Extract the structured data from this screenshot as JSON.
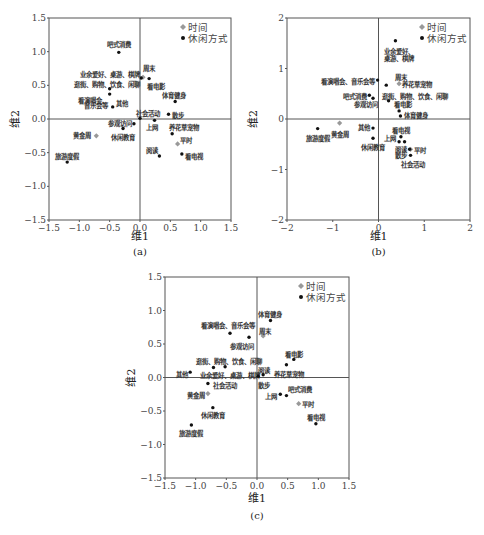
{
  "chart_data": [
    {
      "id": "a",
      "type": "scatter",
      "caption": "(a)",
      "xlabel": "维1",
      "ylabel": "维2",
      "xlim": [
        -1.5,
        1.5
      ],
      "ylim": [
        -1.5,
        1.5
      ],
      "xticks": [
        -1.5,
        -1.0,
        -0.5,
        0.0,
        0.5,
        1.0,
        1.5
      ],
      "yticks": [
        -1.5,
        -1.0,
        -0.5,
        0.0,
        0.5,
        1.0,
        1.5
      ],
      "tick_labels_x": [
        "−1.5",
        "−1.0",
        "−0.5",
        "0.0",
        "0.5",
        "1.0",
        "1.5"
      ],
      "tick_labels_y": [
        "−1.5",
        "−1.0",
        "−0.5",
        "0.0",
        "0.5",
        "1.0",
        "1.5"
      ],
      "grid": false,
      "legend": {
        "position": "top-right",
        "entries": [
          {
            "label": "时间",
            "marker": "diamond",
            "color": "#999999"
          },
          {
            "label": "休闲方式",
            "marker": "circle",
            "color": "#111111"
          }
        ]
      },
      "series": [
        {
          "name": "时间",
          "points": [
            {
              "label": "周末",
              "x": 0.05,
              "y": 0.62,
              "lx": 0.05,
              "ly": 0.75,
              "anchor": "start"
            },
            {
              "label": "平时",
              "x": 0.62,
              "y": -0.37,
              "lx": 0.66,
              "ly": -0.32,
              "anchor": "start"
            },
            {
              "label": "黄金周",
              "x": -0.72,
              "y": -0.25,
              "lx": -0.8,
              "ly": -0.25,
              "anchor": "end"
            }
          ]
        },
        {
          "name": "休闲方式",
          "points": [
            {
              "label": "吧式消费",
              "x": -0.35,
              "y": 0.99,
              "lx": -0.35,
              "ly": 1.1,
              "anchor": "middle"
            },
            {
              "label": "业余爱好、桌游、棋牌",
              "x": 0.02,
              "y": 0.61,
              "lx": 0.0,
              "ly": 0.66,
              "anchor": "end"
            },
            {
              "label": "看电影",
              "x": 0.15,
              "y": 0.6,
              "lx": 0.12,
              "ly": 0.48,
              "anchor": "start"
            },
            {
              "label": "逛街、购物、饮食、闲聊",
              "x": -0.5,
              "y": 0.45,
              "lx": 0.0,
              "ly": 0.51,
              "anchor": "end"
            },
            {
              "label": "看演唱会、",
              "x": -0.5,
              "y": 0.37,
              "lx": -0.53,
              "ly": 0.28,
              "anchor": "end"
            },
            {
              "label": "音乐会等",
              "x": -0.5,
              "y": 0.37,
              "lx": -0.53,
              "ly": 0.2,
              "anchor": "end"
            },
            {
              "label": "其他",
              "x": -0.45,
              "y": 0.18,
              "lx": -0.4,
              "ly": 0.23,
              "anchor": "start"
            },
            {
              "label": "体育健身",
              "x": 0.58,
              "y": 0.26,
              "lx": 0.56,
              "ly": 0.35,
              "anchor": "middle"
            },
            {
              "label": "社会活动",
              "x": 0.0,
              "y": 0.01,
              "lx": -0.07,
              "ly": 0.08,
              "anchor": "start"
            },
            {
              "label": "散步",
              "x": 0.47,
              "y": 0.07,
              "lx": 0.53,
              "ly": 0.05,
              "anchor": "start"
            },
            {
              "label": "上网",
              "x": 0.24,
              "y": -0.02,
              "lx": 0.1,
              "ly": -0.13,
              "anchor": "start"
            },
            {
              "label": "参观访问",
              "x": -0.1,
              "y": -0.07,
              "lx": -0.13,
              "ly": -0.07,
              "anchor": "end"
            },
            {
              "label": "休闲教育",
              "x": -0.28,
              "y": -0.14,
              "lx": -0.28,
              "ly": -0.27,
              "anchor": "middle"
            },
            {
              "label": "养花草宠物",
              "x": 0.53,
              "y": -0.22,
              "lx": 0.48,
              "ly": -0.13,
              "anchor": "start"
            },
            {
              "label": "阅读",
              "x": 0.32,
              "y": -0.55,
              "lx": 0.3,
              "ly": -0.47,
              "anchor": "end"
            },
            {
              "label": "看电视",
              "x": 0.69,
              "y": -0.52,
              "lx": 0.74,
              "ly": -0.55,
              "anchor": "start"
            },
            {
              "label": "旅游度假",
              "x": -1.2,
              "y": -0.64,
              "lx": -1.2,
              "ly": -0.55,
              "anchor": "middle"
            }
          ]
        }
      ]
    },
    {
      "id": "b",
      "type": "scatter",
      "caption": "(b)",
      "xlabel": "维1",
      "ylabel": "维2",
      "xlim": [
        -2,
        2
      ],
      "ylim": [
        -2,
        2
      ],
      "xticks": [
        -2,
        -1,
        0,
        1,
        2
      ],
      "yticks": [
        -2,
        -1,
        0,
        1,
        2
      ],
      "tick_labels_x": [
        "−2",
        "−1",
        "0",
        "1",
        "2"
      ],
      "tick_labels_y": [
        "−2",
        "−1",
        "0",
        "1",
        "2"
      ],
      "grid": false,
      "legend": {
        "position": "top-right",
        "entries": [
          {
            "label": "时间",
            "marker": "diamond",
            "color": "#999999"
          },
          {
            "label": "休闲方式",
            "marker": "circle",
            "color": "#111111"
          }
        ]
      },
      "series": [
        {
          "name": "时间",
          "points": [
            {
              "label": "周末",
              "x": 0.45,
              "y": 0.7,
              "lx": 0.5,
              "ly": 0.82,
              "anchor": "middle"
            },
            {
              "label": "平时",
              "x": 0.7,
              "y": -0.6,
              "lx": 0.78,
              "ly": -0.62,
              "anchor": "start"
            },
            {
              "label": "黄金周",
              "x": -0.85,
              "y": -0.08,
              "lx": -0.85,
              "ly": -0.3,
              "anchor": "middle"
            }
          ]
        },
        {
          "name": "休闲方式",
          "points": [
            {
              "label": "业余爱好、",
              "x": 0.37,
              "y": 1.55,
              "lx": 0.11,
              "ly": 1.33,
              "anchor": "start"
            },
            {
              "label": "桌游、棋牌",
              "x": 0.37,
              "y": 1.55,
              "lx": 0.11,
              "ly": 1.2,
              "anchor": "start"
            },
            {
              "label": "看演唱会、音乐会等",
              "x": -0.02,
              "y": 0.77,
              "lx": -0.07,
              "ly": 0.75,
              "anchor": "end"
            },
            {
              "label": "养花草宠物",
              "x": 0.17,
              "y": 0.67,
              "lx": 0.52,
              "ly": 0.69,
              "anchor": "start"
            },
            {
              "label": "吧式消费",
              "x": -0.2,
              "y": 0.47,
              "lx": -0.25,
              "ly": 0.45,
              "anchor": "end"
            },
            {
              "label": "参观访问",
              "x": -0.12,
              "y": 0.41,
              "lx": -0.02,
              "ly": 0.28,
              "anchor": "end"
            },
            {
              "label": "逛街、购物、饮食、闲聊",
              "x": 0.22,
              "y": 0.36,
              "lx": 0.08,
              "ly": 0.45,
              "anchor": "start"
            },
            {
              "label": "看电影",
              "x": 0.45,
              "y": 0.16,
              "lx": 0.33,
              "ly": 0.28,
              "anchor": "start"
            },
            {
              "label": "体育健身",
              "x": 0.48,
              "y": 0.06,
              "lx": 0.55,
              "ly": 0.07,
              "anchor": "start"
            },
            {
              "label": "其他",
              "x": -0.12,
              "y": -0.18,
              "lx": -0.18,
              "ly": -0.16,
              "anchor": "end"
            },
            {
              "label": "旅游度假",
              "x": -1.33,
              "y": -0.19,
              "lx": -1.33,
              "ly": -0.38,
              "anchor": "middle"
            },
            {
              "label": "休闲教育",
              "x": -0.12,
              "y": -0.38,
              "lx": -0.12,
              "ly": -0.56,
              "anchor": "middle"
            },
            {
              "label": "看电视",
              "x": 0.49,
              "y": -0.35,
              "lx": 0.5,
              "ly": -0.22,
              "anchor": "middle"
            },
            {
              "label": "上网",
              "x": 0.45,
              "y": -0.45,
              "lx": 0.38,
              "ly": -0.38,
              "anchor": "end"
            },
            {
              "label": "阅读",
              "x": 0.57,
              "y": -0.45,
              "lx": 0.37,
              "ly": -0.6,
              "anchor": "start"
            },
            {
              "label": "散步",
              "x": 0.68,
              "y": -0.6,
              "lx": 0.37,
              "ly": -0.73,
              "anchor": "start"
            },
            {
              "label": "社会活动",
              "x": 0.7,
              "y": -0.72,
              "lx": 0.75,
              "ly": -0.9,
              "anchor": "middle"
            }
          ]
        }
      ]
    },
    {
      "id": "c",
      "type": "scatter",
      "caption": "(c)",
      "xlabel": "维1",
      "ylabel": "维2",
      "xlim": [
        -1.5,
        1.5
      ],
      "ylim": [
        -1.5,
        1.5
      ],
      "xticks": [
        -1.5,
        -1.0,
        -0.5,
        0.0,
        0.5,
        1.0,
        1.5
      ],
      "yticks": [
        -1.5,
        -1.0,
        -0.5,
        0.0,
        0.5,
        1.0,
        1.5
      ],
      "tick_labels_x": [
        "−1.5",
        "−1.0",
        "−0.5",
        "0.0",
        "0.5",
        "1.0",
        "1.5"
      ],
      "tick_labels_y": [
        "−1.5",
        "−1.0",
        "−0.5",
        "0.0",
        "0.5",
        "1.0",
        "1.5"
      ],
      "grid": false,
      "legend": {
        "position": "top-right",
        "entries": [
          {
            "label": "时间",
            "marker": "diamond",
            "color": "#999999"
          },
          {
            "label": "休闲方式",
            "marker": "circle",
            "color": "#111111"
          }
        ]
      },
      "series": [
        {
          "name": "时间",
          "points": [
            {
              "label": "周末",
              "x": 0.1,
              "y": 0.62,
              "lx": 0.04,
              "ly": 0.68,
              "anchor": "start"
            },
            {
              "label": "平时",
              "x": 0.68,
              "y": -0.39,
              "lx": 0.73,
              "ly": -0.41,
              "anchor": "start"
            },
            {
              "label": "黄金周",
              "x": -0.8,
              "y": -0.24,
              "lx": -0.84,
              "ly": -0.27,
              "anchor": "end"
            }
          ]
        },
        {
          "name": "休闲方式",
          "points": [
            {
              "label": "体育健身",
              "x": 0.22,
              "y": 0.85,
              "lx": 0.02,
              "ly": 0.94,
              "anchor": "start"
            },
            {
              "label": "看演唱会、音乐会等",
              "x": -0.44,
              "y": 0.66,
              "lx": -0.48,
              "ly": 0.77,
              "anchor": "middle"
            },
            {
              "label": "参观访问",
              "x": -0.13,
              "y": 0.6,
              "lx": -0.25,
              "ly": 0.47,
              "anchor": "middle"
            },
            {
              "label": "看电影",
              "x": 0.6,
              "y": 0.27,
              "lx": 0.46,
              "ly": 0.35,
              "anchor": "start"
            },
            {
              "label": "逛街、购物、饮食、闲聊",
              "x": -0.71,
              "y": 0.15,
              "lx": -0.45,
              "ly": 0.24,
              "anchor": "middle"
            },
            {
              "label": "业余爱好、桌游、棋牌",
              "x": -0.52,
              "y": 0.16,
              "lx": -0.44,
              "ly": 0.03,
              "anchor": "middle"
            },
            {
              "label": "阅读",
              "x": 0.48,
              "y": 0.19,
              "lx": 0.02,
              "ly": 0.1,
              "anchor": "start"
            },
            {
              "label": "其他",
              "x": -1.09,
              "y": 0.08,
              "lx": -1.12,
              "ly": 0.05,
              "anchor": "end"
            },
            {
              "label": "养花草宠物",
              "x": 0.1,
              "y": 0.04,
              "lx": 0.28,
              "ly": 0.05,
              "anchor": "start"
            },
            {
              "label": "散步",
              "x": 0.02,
              "y": 0.02,
              "lx": 0.02,
              "ly": -0.12,
              "anchor": "start"
            },
            {
              "label": "社会活动",
              "x": -0.8,
              "y": -0.09,
              "lx": -0.72,
              "ly": -0.12,
              "anchor": "start"
            },
            {
              "label": "上网",
              "x": 0.38,
              "y": -0.25,
              "lx": 0.33,
              "ly": -0.28,
              "anchor": "end"
            },
            {
              "label": "吧式消费",
              "x": 0.48,
              "y": -0.27,
              "lx": 0.5,
              "ly": -0.18,
              "anchor": "start"
            },
            {
              "label": "休闲教育",
              "x": -0.72,
              "y": -0.45,
              "lx": -0.72,
              "ly": -0.57,
              "anchor": "middle"
            },
            {
              "label": "看电视",
              "x": 0.96,
              "y": -0.69,
              "lx": 0.96,
              "ly": -0.6,
              "anchor": "middle"
            },
            {
              "label": "旅游度假",
              "x": -1.07,
              "y": -0.71,
              "lx": -1.07,
              "ly": -0.84,
              "anchor": "middle"
            }
          ]
        }
      ]
    }
  ],
  "panels": [
    {
      "id": "a",
      "left": 49,
      "top": 18,
      "right": 231,
      "bottom": 220,
      "caption_y": 255,
      "xlabel_y": 240
    },
    {
      "id": "b",
      "left": 287,
      "top": 18,
      "right": 470,
      "bottom": 220,
      "caption_y": 255,
      "xlabel_y": 240
    },
    {
      "id": "c",
      "left": 165,
      "top": 277,
      "right": 349,
      "bottom": 478,
      "caption_y": 519,
      "xlabel_y": 502
    }
  ]
}
